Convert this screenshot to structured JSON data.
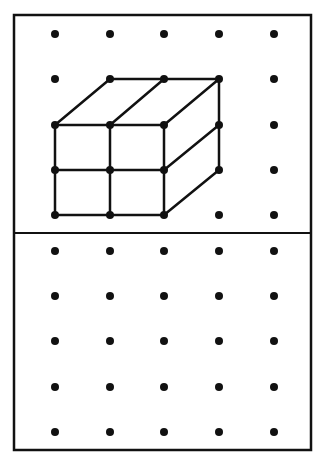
{
  "figure": {
    "colors": {
      "ink": "#111111",
      "paper": "#ffffff"
    },
    "grid": {
      "columns_x": [
        55,
        110,
        164,
        219,
        274
      ],
      "top_rows_y": [
        34,
        79,
        125,
        170,
        215
      ],
      "bottom_rows_y": [
        251,
        296,
        341,
        387,
        432
      ]
    },
    "top_panel": {
      "label": "cube drawing",
      "shape": "2x2x2 cube made of unit cubes (front 2x2 face, top and right side faces shown)"
    },
    "bottom_panel": {
      "label": "empty dot grid"
    }
  }
}
